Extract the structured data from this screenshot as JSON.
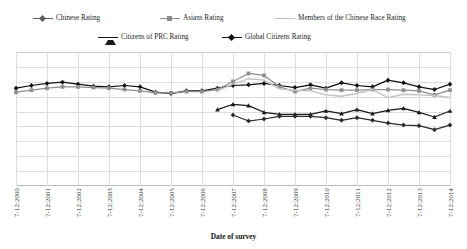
{
  "legend": {
    "items": [
      {
        "label": "Chinese Rating",
        "marker": "diamond-marker",
        "color": "#5f5f5f",
        "x": 33,
        "y": 14
      },
      {
        "label": "Asians Rating",
        "marker": "square-marker",
        "color": "#8c8c8c",
        "x": 160,
        "y": 14
      },
      {
        "label": "Members of the Chinese Race Rating",
        "marker": "line-marker",
        "color": "#bdbdbd",
        "x": 275,
        "y": 14
      },
      {
        "label": "Citizens of PRC Rating",
        "marker": "triangle-marker",
        "color": "#1a1a1a",
        "x": 98,
        "y": 33
      },
      {
        "label": "Global Citizens Rating",
        "marker": "diamond-marker",
        "color": "#111111",
        "x": 222,
        "y": 33
      }
    ]
  },
  "axis": {
    "x_title": "Date of survey",
    "x_ticks": [
      "7-12:2000",
      "7-12:2001",
      "7-12:2002",
      "7-12:2003",
      "7-12:2004",
      "7-12:2005",
      "7-12:2006",
      "7-12:2007",
      "7-12:2008",
      "7-12:2009",
      "7-12:2010",
      "7-12:2011",
      "7-12:2012",
      "7-12:2013",
      "7-12:2014"
    ]
  },
  "chart_data": {
    "type": "line",
    "title": "",
    "xlabel": "Date of survey",
    "ylabel": "",
    "grid": true,
    "legend_position": "top",
    "x": [
      "7-12:2000",
      "7-12:2001",
      "7-12:2002",
      "7-12:2003",
      "7-12:2004",
      "7-12:2005",
      "7-12:2006",
      "7-12:2007",
      "7-12:2008",
      "7-12:2009",
      "7-12:2010",
      "7-12:2011",
      "7-12:2012",
      "7-12:2013",
      "7-12:2014"
    ],
    "ylim": [
      0,
      100
    ],
    "xlim": [
      2000,
      2014
    ],
    "note": "Half-yearly survey points (two per year, 7-12 marks). Values are identification-strength ratings read off the gridlines; y-axis is unlabeled in the figure.",
    "series": [
      {
        "name": "Global Citizens Rating",
        "marker": "diamond",
        "color": "#111111",
        "points": [
          {
            "x": 2000.0,
            "y": 73.0
          },
          {
            "x": 2000.5,
            "y": 75.0
          },
          {
            "x": 2001.0,
            "y": 76.5
          },
          {
            "x": 2001.5,
            "y": 77.5
          },
          {
            "x": 2002.0,
            "y": 76.0
          },
          {
            "x": 2002.5,
            "y": 74.5
          },
          {
            "x": 2003.0,
            "y": 74.0
          },
          {
            "x": 2003.5,
            "y": 75.0
          },
          {
            "x": 2004.0,
            "y": 74.0
          },
          {
            "x": 2004.5,
            "y": 70.0
          },
          {
            "x": 2005.0,
            "y": 69.0
          },
          {
            "x": 2005.5,
            "y": 71.0
          },
          {
            "x": 2006.0,
            "y": 71.0
          },
          {
            "x": 2006.5,
            "y": 73.0
          },
          {
            "x": 2007.0,
            "y": 75.0
          },
          {
            "x": 2007.5,
            "y": 75.5
          },
          {
            "x": 2008.0,
            "y": 76.5
          },
          {
            "x": 2008.5,
            "y": 75.0
          },
          {
            "x": 2009.0,
            "y": 73.5
          },
          {
            "x": 2009.5,
            "y": 75.5
          },
          {
            "x": 2010.0,
            "y": 73.0
          },
          {
            "x": 2010.5,
            "y": 77.0
          },
          {
            "x": 2011.0,
            "y": 75.0
          },
          {
            "x": 2011.5,
            "y": 74.0
          },
          {
            "x": 2012.0,
            "y": 79.0
          },
          {
            "x": 2012.5,
            "y": 77.0
          },
          {
            "x": 2013.0,
            "y": 74.0
          },
          {
            "x": 2013.5,
            "y": 72.0
          },
          {
            "x": 2014.0,
            "y": 76.0
          }
        ]
      },
      {
        "name": "Asians Rating",
        "marker": "square",
        "color": "#8f8f8f",
        "points": [
          {
            "x": 2000.0,
            "y": 70.0
          },
          {
            "x": 2000.5,
            "y": 71.5
          },
          {
            "x": 2001.0,
            "y": 73.0
          },
          {
            "x": 2001.5,
            "y": 74.0
          },
          {
            "x": 2002.0,
            "y": 74.0
          },
          {
            "x": 2002.5,
            "y": 73.5
          },
          {
            "x": 2003.0,
            "y": 73.0
          },
          {
            "x": 2003.5,
            "y": 72.0
          },
          {
            "x": 2004.0,
            "y": 71.0
          },
          {
            "x": 2004.5,
            "y": 69.5
          },
          {
            "x": 2005.0,
            "y": 69.5
          },
          {
            "x": 2005.5,
            "y": 70.5
          },
          {
            "x": 2006.0,
            "y": 70.5
          },
          {
            "x": 2006.5,
            "y": 72.0
          },
          {
            "x": 2007.0,
            "y": 78.0
          },
          {
            "x": 2007.5,
            "y": 84.0
          },
          {
            "x": 2008.0,
            "y": 82.5
          },
          {
            "x": 2008.5,
            "y": 74.0
          },
          {
            "x": 2009.0,
            "y": 70.5
          },
          {
            "x": 2009.5,
            "y": 73.0
          },
          {
            "x": 2010.0,
            "y": 72.0
          },
          {
            "x": 2010.5,
            "y": 71.5
          },
          {
            "x": 2011.0,
            "y": 71.5
          },
          {
            "x": 2011.5,
            "y": 72.0
          },
          {
            "x": 2012.0,
            "y": 72.0
          },
          {
            "x": 2012.5,
            "y": 71.5
          },
          {
            "x": 2013.0,
            "y": 71.0
          },
          {
            "x": 2013.5,
            "y": 68.0
          },
          {
            "x": 2014.0,
            "y": 71.5
          }
        ]
      },
      {
        "name": "Members of the Chinese Race Rating",
        "marker": "none",
        "color": "#c2c2c2",
        "points": [
          {
            "x": 2006.5,
            "y": 71.0
          },
          {
            "x": 2007.0,
            "y": 76.0
          },
          {
            "x": 2007.5,
            "y": 80.0
          },
          {
            "x": 2008.0,
            "y": 79.0
          },
          {
            "x": 2008.5,
            "y": 72.5
          },
          {
            "x": 2009.0,
            "y": 71.5
          },
          {
            "x": 2009.5,
            "y": 71.0
          },
          {
            "x": 2010.0,
            "y": 68.0
          },
          {
            "x": 2010.5,
            "y": 67.0
          },
          {
            "x": 2011.0,
            "y": 69.0
          },
          {
            "x": 2011.5,
            "y": 72.0
          },
          {
            "x": 2012.0,
            "y": 66.0
          },
          {
            "x": 2012.5,
            "y": 68.5
          },
          {
            "x": 2013.0,
            "y": 68.0
          },
          {
            "x": 2013.5,
            "y": 67.5
          },
          {
            "x": 2014.0,
            "y": 66.0
          }
        ]
      },
      {
        "name": "Citizens of PRC Rating",
        "marker": "triangle",
        "color": "#1a1a1a",
        "points": [
          {
            "x": 2006.5,
            "y": 57.0
          },
          {
            "x": 2007.0,
            "y": 61.0
          },
          {
            "x": 2007.5,
            "y": 60.0
          },
          {
            "x": 2008.0,
            "y": 55.0
          },
          {
            "x": 2008.5,
            "y": 53.5
          },
          {
            "x": 2009.0,
            "y": 53.5
          },
          {
            "x": 2009.5,
            "y": 53.5
          },
          {
            "x": 2010.0,
            "y": 56.0
          },
          {
            "x": 2010.5,
            "y": 54.0
          },
          {
            "x": 2011.0,
            "y": 57.0
          },
          {
            "x": 2011.5,
            "y": 54.0
          },
          {
            "x": 2012.0,
            "y": 56.5
          },
          {
            "x": 2012.5,
            "y": 58.0
          },
          {
            "x": 2013.0,
            "y": 55.0
          },
          {
            "x": 2013.5,
            "y": 51.5
          },
          {
            "x": 2014.0,
            "y": 56.0
          }
        ]
      },
      {
        "name": "Chinese Rating",
        "marker": "diamond",
        "color": "#2b2b2b",
        "points": [
          {
            "x": 2007.0,
            "y": 53.0
          },
          {
            "x": 2007.5,
            "y": 48.5
          },
          {
            "x": 2008.0,
            "y": 50.0
          },
          {
            "x": 2008.5,
            "y": 52.0
          },
          {
            "x": 2009.0,
            "y": 52.0
          },
          {
            "x": 2009.5,
            "y": 52.0
          },
          {
            "x": 2010.0,
            "y": 51.0
          },
          {
            "x": 2010.5,
            "y": 49.0
          },
          {
            "x": 2011.0,
            "y": 51.0
          },
          {
            "x": 2011.5,
            "y": 49.0
          },
          {
            "x": 2012.0,
            "y": 47.0
          },
          {
            "x": 2012.5,
            "y": 45.5
          },
          {
            "x": 2013.0,
            "y": 45.0
          },
          {
            "x": 2013.5,
            "y": 42.0
          },
          {
            "x": 2014.0,
            "y": 45.5
          }
        ]
      }
    ]
  }
}
